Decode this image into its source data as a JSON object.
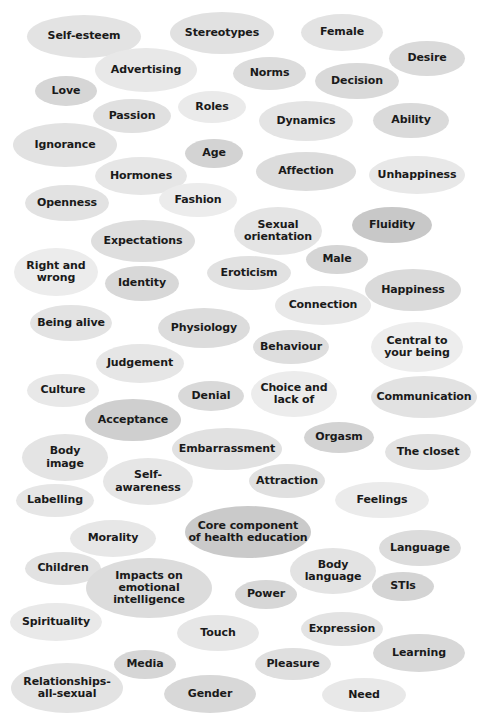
{
  "diagram": {
    "type": "word-cloud",
    "title": "",
    "background_color": "#ffffff",
    "text_color": "#1a1a1a",
    "shape": "ellipse",
    "palette": [
      "#eeeeee",
      "#e6e6e6",
      "#dddddd",
      "#d4d4d4",
      "#cccccc",
      "#c3c3c3"
    ],
    "item_count": 63,
    "items": [
      {
        "label": "Self-esteem",
        "x": 27,
        "y": 15,
        "w": 114,
        "h": 43,
        "fill": "#e3e3e3",
        "font": 11
      },
      {
        "label": "Stereotypes",
        "x": 170,
        "y": 12,
        "w": 104,
        "h": 42,
        "fill": "#e1e1e1",
        "font": 11
      },
      {
        "label": "Female",
        "x": 301,
        "y": 14,
        "w": 82,
        "h": 37,
        "fill": "#e3e3e3",
        "font": 11
      },
      {
        "label": "Desire",
        "x": 389,
        "y": 41,
        "w": 76,
        "h": 35,
        "fill": "#dadada",
        "font": 11
      },
      {
        "label": "Advertising",
        "x": 95,
        "y": 48,
        "w": 102,
        "h": 44,
        "fill": "#e8e8e8",
        "font": 11
      },
      {
        "label": "Norms",
        "x": 233,
        "y": 57,
        "w": 73,
        "h": 33,
        "fill": "#dcdcdc",
        "font": 11
      },
      {
        "label": "Decision",
        "x": 315,
        "y": 63,
        "w": 84,
        "h": 36,
        "fill": "#d9d9d9",
        "font": 11
      },
      {
        "label": "Love",
        "x": 35,
        "y": 76,
        "w": 62,
        "h": 30,
        "fill": "#d6d6d6",
        "font": 11
      },
      {
        "label": "Roles",
        "x": 178,
        "y": 91,
        "w": 68,
        "h": 32,
        "fill": "#eaeaea",
        "font": 11
      },
      {
        "label": "Passion",
        "x": 93,
        "y": 99,
        "w": 78,
        "h": 34,
        "fill": "#e0e0e0",
        "font": 11
      },
      {
        "label": "Dynamics",
        "x": 259,
        "y": 101,
        "w": 94,
        "h": 40,
        "fill": "#e4e4e4",
        "font": 11
      },
      {
        "label": "Ability",
        "x": 373,
        "y": 103,
        "w": 76,
        "h": 35,
        "fill": "#dadada",
        "font": 11
      },
      {
        "label": "Ignorance",
        "x": 13,
        "y": 123,
        "w": 104,
        "h": 44,
        "fill": "#e2e2e2",
        "font": 11
      },
      {
        "label": "Age",
        "x": 185,
        "y": 139,
        "w": 58,
        "h": 29,
        "fill": "#d3d3d3",
        "font": 11
      },
      {
        "label": "Affection",
        "x": 256,
        "y": 152,
        "w": 100,
        "h": 39,
        "fill": "#dcdcdc",
        "font": 11
      },
      {
        "label": "Hormones",
        "x": 95,
        "y": 157,
        "w": 92,
        "h": 38,
        "fill": "#e6e6e6",
        "font": 11
      },
      {
        "label": "Unhappiness",
        "x": 369,
        "y": 156,
        "w": 96,
        "h": 38,
        "fill": "#e8e8e8",
        "font": 11
      },
      {
        "label": "Openness",
        "x": 25,
        "y": 185,
        "w": 84,
        "h": 36,
        "fill": "#e2e2e2",
        "font": 11
      },
      {
        "label": "Fashion",
        "x": 159,
        "y": 183,
        "w": 78,
        "h": 34,
        "fill": "#ececec",
        "font": 11
      },
      {
        "label": "Sexual\norientation",
        "x": 234,
        "y": 207,
        "w": 88,
        "h": 48,
        "fill": "#e4e4e4",
        "font": 11
      },
      {
        "label": "Fluidity",
        "x": 352,
        "y": 207,
        "w": 80,
        "h": 36,
        "fill": "#c8c8c8",
        "font": 11
      },
      {
        "label": "Expectations",
        "x": 91,
        "y": 220,
        "w": 104,
        "h": 42,
        "fill": "#dedede",
        "font": 11
      },
      {
        "label": "Male",
        "x": 306,
        "y": 245,
        "w": 62,
        "h": 29,
        "fill": "#d5d5d5",
        "font": 11
      },
      {
        "label": "Right and\nwrong",
        "x": 14,
        "y": 248,
        "w": 84,
        "h": 48,
        "fill": "#ececec",
        "font": 11
      },
      {
        "label": "Eroticism",
        "x": 207,
        "y": 256,
        "w": 84,
        "h": 34,
        "fill": "#e1e1e1",
        "font": 11
      },
      {
        "label": "Identity",
        "x": 105,
        "y": 266,
        "w": 74,
        "h": 35,
        "fill": "#d8d8d8",
        "font": 11
      },
      {
        "label": "Happiness",
        "x": 365,
        "y": 269,
        "w": 96,
        "h": 42,
        "fill": "#dadada",
        "font": 11
      },
      {
        "label": "Connection",
        "x": 275,
        "y": 286,
        "w": 96,
        "h": 39,
        "fill": "#e8e8e8",
        "font": 11
      },
      {
        "label": "Being alive",
        "x": 30,
        "y": 305,
        "w": 82,
        "h": 36,
        "fill": "#e3e3e3",
        "font": 11
      },
      {
        "label": "Physiology",
        "x": 158,
        "y": 308,
        "w": 92,
        "h": 40,
        "fill": "#dcdcdc",
        "font": 11
      },
      {
        "label": "Behaviour",
        "x": 253,
        "y": 330,
        "w": 76,
        "h": 34,
        "fill": "#dedede",
        "font": 11
      },
      {
        "label": "Central to\nyour being",
        "x": 371,
        "y": 322,
        "w": 92,
        "h": 50,
        "fill": "#ededed",
        "font": 11
      },
      {
        "label": "Judgement",
        "x": 96,
        "y": 344,
        "w": 88,
        "h": 39,
        "fill": "#e6e6e6",
        "font": 11
      },
      {
        "label": "Culture",
        "x": 27,
        "y": 374,
        "w": 72,
        "h": 33,
        "fill": "#e8e8e8",
        "font": 11
      },
      {
        "label": "Denial",
        "x": 178,
        "y": 381,
        "w": 66,
        "h": 30,
        "fill": "#d9d9d9",
        "font": 11
      },
      {
        "label": "Choice and\nlack of",
        "x": 251,
        "y": 371,
        "w": 86,
        "h": 46,
        "fill": "#ececec",
        "font": 11
      },
      {
        "label": "Communication",
        "x": 371,
        "y": 376,
        "w": 106,
        "h": 42,
        "fill": "#e2e2e2",
        "font": 11
      },
      {
        "label": "Acceptance",
        "x": 85,
        "y": 399,
        "w": 96,
        "h": 42,
        "fill": "#cfcfcf",
        "font": 11
      },
      {
        "label": "Embarrassment",
        "x": 172,
        "y": 428,
        "w": 110,
        "h": 42,
        "fill": "#e1e1e1",
        "font": 11
      },
      {
        "label": "Orgasm",
        "x": 304,
        "y": 422,
        "w": 70,
        "h": 31,
        "fill": "#d3d3d3",
        "font": 11
      },
      {
        "label": "Body\nimage",
        "x": 22,
        "y": 434,
        "w": 86,
        "h": 47,
        "fill": "#e4e4e4",
        "font": 11
      },
      {
        "label": "The closet",
        "x": 385,
        "y": 434,
        "w": 86,
        "h": 36,
        "fill": "#e2e2e2",
        "font": 11
      },
      {
        "label": "Self-\nawareness",
        "x": 103,
        "y": 458,
        "w": 90,
        "h": 47,
        "fill": "#e6e6e6",
        "font": 11
      },
      {
        "label": "Attraction",
        "x": 249,
        "y": 464,
        "w": 76,
        "h": 34,
        "fill": "#e0e0e0",
        "font": 11
      },
      {
        "label": "Labelling",
        "x": 16,
        "y": 484,
        "w": 78,
        "h": 33,
        "fill": "#e6e6e6",
        "font": 11
      },
      {
        "label": "Feelings",
        "x": 335,
        "y": 482,
        "w": 94,
        "h": 36,
        "fill": "#ebebeb",
        "font": 11
      },
      {
        "label": "Core component\nof health education",
        "x": 185,
        "y": 506,
        "w": 126,
        "h": 52,
        "fill": "#cacaca",
        "font": 11
      },
      {
        "label": "Morality",
        "x": 70,
        "y": 520,
        "w": 86,
        "h": 37,
        "fill": "#e7e7e7",
        "font": 11
      },
      {
        "label": "Language",
        "x": 379,
        "y": 530,
        "w": 82,
        "h": 36,
        "fill": "#dcdcdc",
        "font": 11
      },
      {
        "label": "Children",
        "x": 25,
        "y": 552,
        "w": 76,
        "h": 33,
        "fill": "#e2e2e2",
        "font": 11
      },
      {
        "label": "Body\nlanguage",
        "x": 290,
        "y": 548,
        "w": 86,
        "h": 46,
        "fill": "#e3e3e3",
        "font": 11
      },
      {
        "label": "Impacts on\nemotional\nintelligence",
        "x": 86,
        "y": 558,
        "w": 126,
        "h": 60,
        "fill": "#dcdcdc",
        "font": 11
      },
      {
        "label": "STIs",
        "x": 372,
        "y": 572,
        "w": 62,
        "h": 29,
        "fill": "#d4d4d4",
        "font": 11
      },
      {
        "label": "Power",
        "x": 235,
        "y": 580,
        "w": 62,
        "h": 29,
        "fill": "#d7d7d7",
        "font": 11
      },
      {
        "label": "Spirituality",
        "x": 10,
        "y": 603,
        "w": 92,
        "h": 38,
        "fill": "#e9e9e9",
        "font": 11
      },
      {
        "label": "Expression",
        "x": 301,
        "y": 612,
        "w": 82,
        "h": 34,
        "fill": "#e3e3e3",
        "font": 11
      },
      {
        "label": "Touch",
        "x": 177,
        "y": 615,
        "w": 82,
        "h": 36,
        "fill": "#e6e6e6",
        "font": 11
      },
      {
        "label": "Learning",
        "x": 373,
        "y": 634,
        "w": 92,
        "h": 38,
        "fill": "#d8d8d8",
        "font": 11
      },
      {
        "label": "Media",
        "x": 114,
        "y": 650,
        "w": 62,
        "h": 29,
        "fill": "#d6d6d6",
        "font": 11
      },
      {
        "label": "Pleasure",
        "x": 255,
        "y": 648,
        "w": 76,
        "h": 32,
        "fill": "#dfdfdf",
        "font": 11
      },
      {
        "label": "Relationships-\nall-sexual",
        "x": 11,
        "y": 663,
        "w": 112,
        "h": 50,
        "fill": "#e3e3e3",
        "font": 11
      },
      {
        "label": "Gender",
        "x": 164,
        "y": 675,
        "w": 92,
        "h": 38,
        "fill": "#d8d8d8",
        "font": 11
      },
      {
        "label": "Need",
        "x": 322,
        "y": 678,
        "w": 84,
        "h": 34,
        "fill": "#e8e8e8",
        "font": 11
      }
    ]
  }
}
